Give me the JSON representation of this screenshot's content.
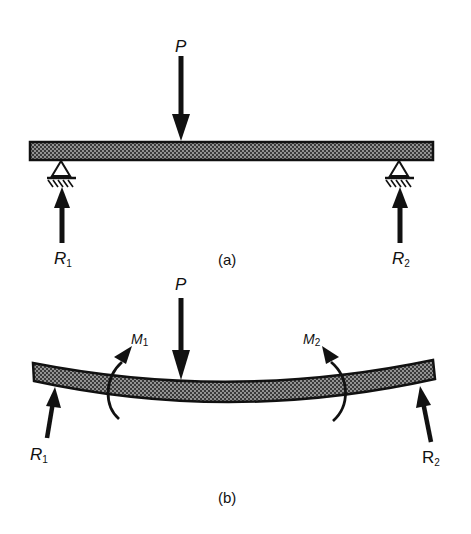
{
  "figure": {
    "colors": {
      "ink": "#111111",
      "beam_fill": "#6a6a6a",
      "background": "#ffffff"
    },
    "panel_a": {
      "caption": "(a)",
      "load_label": "P",
      "reactions": [
        {
          "main": "R",
          "sub": "1"
        },
        {
          "main": "R",
          "sub": "2"
        }
      ],
      "supports": [
        "pin-support-left",
        "pin-support-right"
      ]
    },
    "panel_b": {
      "caption": "(b)",
      "load_label": "P",
      "moments": [
        {
          "main": "M",
          "sub": "1"
        },
        {
          "main": "M",
          "sub": "2"
        }
      ],
      "reactions": [
        {
          "main": "R",
          "sub": "1"
        },
        {
          "main": "R",
          "sub": "2"
        }
      ]
    }
  }
}
